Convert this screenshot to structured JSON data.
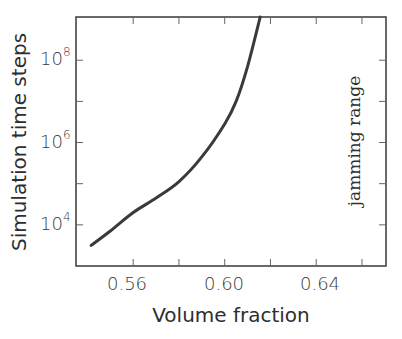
{
  "chart_data": {
    "type": "line",
    "title": "",
    "xlabel": "Volume fraction",
    "ylabel": "Simulation time steps",
    "xlim": [
      0.535,
      0.6705
    ],
    "ylim_log10": [
      3.0,
      9.05
    ],
    "yscale": "log",
    "grid": false,
    "legend": null,
    "x_ticks": [
      0.56,
      0.6,
      0.64
    ],
    "x_tick_labels": [
      "0.56",
      "0.60",
      "0.64"
    ],
    "x_minor_ticks": [
      0.58,
      0.62,
      0.66
    ],
    "y_ticks_log10": [
      4,
      6,
      8
    ],
    "y_tick_labels": [
      {
        "base": "10",
        "exp": "4"
      },
      {
        "base": "10",
        "exp": "6"
      },
      {
        "base": "10",
        "exp": "8"
      }
    ],
    "y_minor_ticks_log10": [
      5,
      7
    ],
    "annotations": [
      {
        "text": "jamming range",
        "orientation": "vertical",
        "position": "right"
      }
    ],
    "series": [
      {
        "name": "simulation time steps",
        "color": "#3a3a3a",
        "x": [
          0.5416,
          0.55,
          0.56,
          0.57,
          0.58,
          0.59,
          0.6,
          0.605,
          0.61,
          0.6155
        ],
        "y_log10": [
          3.5,
          3.85,
          4.3,
          4.65,
          5.05,
          5.65,
          6.45,
          7.0,
          7.85,
          9.05
        ]
      }
    ]
  },
  "labels": {
    "xlabel": "Volume fraction",
    "ylabel": "Simulation time steps",
    "annotation": "jamming range",
    "xticks": [
      "0.56",
      "0.60",
      "0.64"
    ],
    "yticks_base": [
      "10",
      "10",
      "10"
    ],
    "yticks_exp": [
      "4",
      "6",
      "8"
    ]
  }
}
